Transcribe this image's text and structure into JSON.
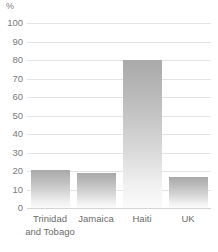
{
  "chart_data": {
    "type": "bar",
    "title": "",
    "xlabel": "",
    "ylabel": "%",
    "unit_label": "%",
    "categories": [
      "Trinidad and Tobago",
      "Jamaica",
      "Haiti",
      "UK"
    ],
    "category_lines": [
      [
        "Trinidad",
        "and Tobago"
      ],
      [
        "Jamaica"
      ],
      [
        "Haiti"
      ],
      [
        "UK"
      ]
    ],
    "values": [
      20.5,
      19,
      80,
      16.5
    ],
    "ylim": [
      0,
      100
    ],
    "ytick_step": 10,
    "yticks": [
      "100",
      "90",
      "80",
      "70",
      "60",
      "50",
      "40",
      "30",
      "20",
      "10",
      "0"
    ],
    "ytick_values": [
      100,
      90,
      80,
      70,
      60,
      50,
      40,
      30,
      20,
      10,
      0
    ],
    "grid": true,
    "legend": false,
    "legend_position": "none",
    "colors": {
      "bar_top": "#a9a9a9",
      "bar_bottom": "#fbfbfb",
      "gridline": "#e3e3e3",
      "baseline": "#d4d4d4",
      "text": "#6e6e6e",
      "background": "#ffffff"
    }
  }
}
